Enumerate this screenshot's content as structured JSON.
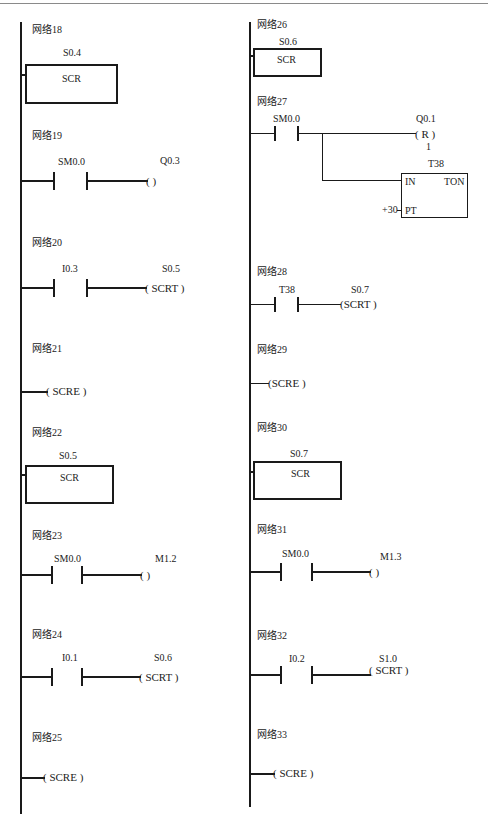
{
  "diagram": {
    "type": "ladder-logic",
    "left_column": {
      "networks": [
        {
          "id": "n18",
          "title": "网络18",
          "kind": "scr",
          "bit": "S0.4",
          "box_label": "SCR"
        },
        {
          "id": "n19",
          "title": "网络19",
          "kind": "contact-coil",
          "contact": "SM0.0",
          "coil": "Q0.3",
          "coil_text": "(       )"
        },
        {
          "id": "n20",
          "title": "网络20",
          "kind": "contact-coil",
          "contact": "I0.3",
          "coil": "S0.5",
          "coil_text": "( SCRT )"
        },
        {
          "id": "n21",
          "title": "网络21",
          "kind": "scre",
          "coil_text": "( SCRE )"
        },
        {
          "id": "n22",
          "title": "网络22",
          "kind": "scr",
          "bit": "S0.5",
          "box_label": "SCR"
        },
        {
          "id": "n23",
          "title": "网络23",
          "kind": "contact-coil",
          "contact": "SM0.0",
          "coil": "M1.2",
          "coil_text": "(       )"
        },
        {
          "id": "n24",
          "title": "网络24",
          "kind": "contact-coil",
          "contact": "I0.1",
          "coil": "S0.6",
          "coil_text": "( SCRT )"
        },
        {
          "id": "n25",
          "title": "网络25",
          "kind": "scre",
          "coil_text": "( SCRE )"
        }
      ]
    },
    "right_column": {
      "networks": [
        {
          "id": "n26",
          "title": "网络26",
          "kind": "scr",
          "bit": "S0.6",
          "box_label": "SCR"
        },
        {
          "id": "n27",
          "title": "网络27",
          "kind": "contact-reset-timer",
          "contact": "SM0.0",
          "reset_coil": "Q0.1",
          "reset_text": "( R )",
          "reset_count": "1",
          "timer": {
            "name": "T38",
            "type": "TON",
            "in_label": "IN",
            "pt_label": "PT",
            "preset": "+30"
          }
        },
        {
          "id": "n28",
          "title": "网络28",
          "kind": "contact-coil",
          "contact": "T38",
          "coil": "S0.7",
          "coil_text": "(SCRT )"
        },
        {
          "id": "n29",
          "title": "网络29",
          "kind": "scre",
          "coil_text": "(SCRE )"
        },
        {
          "id": "n30",
          "title": "网络30",
          "kind": "scr",
          "bit": "S0.7",
          "box_label": "SCR"
        },
        {
          "id": "n31",
          "title": "网络31",
          "kind": "contact-coil",
          "contact": "SM0.0",
          "coil": "M1.3",
          "coil_text": "(       )"
        },
        {
          "id": "n32",
          "title": "网络32",
          "kind": "contact-coil",
          "contact": "I0.2",
          "coil": "S1.0",
          "coil_text": "( SCRT )"
        },
        {
          "id": "n33",
          "title": "网络33",
          "kind": "scre",
          "coil_text": "( SCRE )"
        }
      ]
    }
  }
}
